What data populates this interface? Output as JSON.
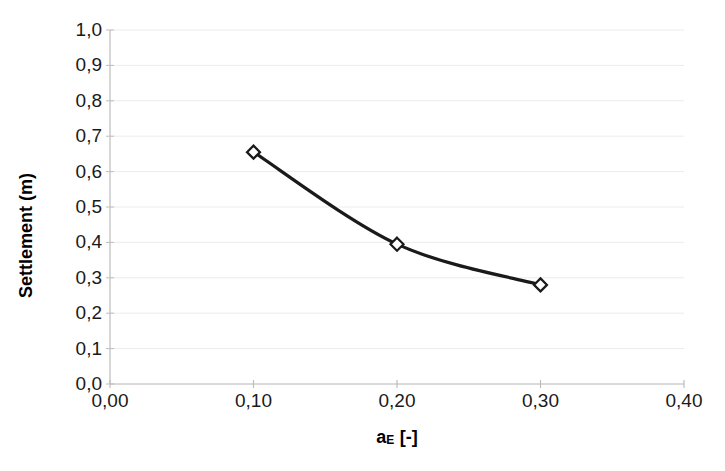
{
  "chart_data": {
    "type": "line",
    "title": "",
    "xlabel": "aE [-]",
    "xlabel_base": "a",
    "xlabel_sub": "E",
    "xlabel_unit": " [-]",
    "ylabel": "Settlement (m)",
    "x": [
      0.1,
      0.2,
      0.3
    ],
    "values": [
      0.655,
      0.395,
      0.28
    ],
    "series": [
      {
        "name": "Settlement",
        "x": [
          0.1,
          0.2,
          0.3
        ],
        "values": [
          0.655,
          0.395,
          0.28
        ]
      }
    ],
    "xlim": [
      0.0,
      0.4
    ],
    "ylim": [
      0.0,
      1.0
    ],
    "x_ticks": [
      0.0,
      0.1,
      0.2,
      0.3,
      0.4
    ],
    "y_ticks": [
      0.0,
      0.1,
      0.2,
      0.3,
      0.4,
      0.5,
      0.6,
      0.7,
      0.8,
      0.9,
      1.0
    ],
    "x_tick_labels": [
      "0,00",
      "0,10",
      "0,20",
      "0,30",
      "0,40"
    ],
    "y_tick_labels": [
      "0,0",
      "0,1",
      "0,2",
      "0,3",
      "0,4",
      "0,5",
      "0,6",
      "0,7",
      "0,8",
      "0,9",
      "1,0"
    ],
    "grid": {
      "horizontal": true,
      "vertical": false,
      "color": "#ececec"
    },
    "legend": {
      "visible": false,
      "position": "none"
    },
    "marker": {
      "shape": "diamond",
      "fill": "#ffffff",
      "edge": "#1a1a1a",
      "size": 13
    },
    "line": {
      "color": "#1a1a1a",
      "width": 3.2,
      "smooth": true
    },
    "decimal_separator": ","
  },
  "axes": {
    "line_color": "#bdbdbd",
    "background": "#ffffff"
  }
}
